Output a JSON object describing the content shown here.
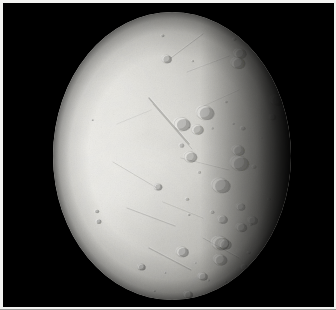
{
  "image": {
    "kind": "spacecraft-photograph",
    "subject": "icy moon",
    "alt_text": "Black-and-white spacecraft photograph of a bright icy moon, lit from the left, showing smooth grooved plains on the left and heavily cratered terrain toward the terminator on the right.",
    "background_color": "#000000",
    "border_color": "#f2f2f0",
    "width_px": 336,
    "height_px": 310
  },
  "body": {
    "name": "icy-moon-disk",
    "illumination": "lit from left, terminator on right",
    "disk": {
      "left_px": 50,
      "top_px": 9,
      "width_px": 238,
      "height_px": 288
    },
    "surface_colors": {
      "bright_limb": "#efeeea",
      "mid_plains": "#d6d5d0",
      "dusk_terrain": "#6b6a67",
      "terminator_shadow": "#0a0a09"
    }
  },
  "terrain": {
    "regions": [
      {
        "name": "smooth-plains",
        "location": "left and upper-center",
        "description": "bright, nearly craterless ice plains"
      },
      {
        "name": "grooved-fractures",
        "location": "center-left",
        "description": "linear ridges and troughs"
      },
      {
        "name": "cratered-highlands",
        "location": "right and lower-right",
        "description": "densely cratered older terrain near terminator"
      }
    ],
    "fractures": [
      {
        "x1": 96,
        "y1": 86,
        "x2": 136,
        "y2": 132,
        "w": 1.4,
        "o": 0.3
      },
      {
        "x1": 100,
        "y1": 92,
        "x2": 139,
        "y2": 137,
        "w": 0.9,
        "o": 0.22
      },
      {
        "x1": 60,
        "y1": 150,
        "x2": 104,
        "y2": 176,
        "w": 1.0,
        "o": 0.16
      },
      {
        "x1": 74,
        "y1": 196,
        "x2": 122,
        "y2": 214,
        "w": 1.1,
        "o": 0.18
      },
      {
        "x1": 118,
        "y1": 46,
        "x2": 150,
        "y2": 22,
        "w": 1.0,
        "o": 0.2
      },
      {
        "x1": 134,
        "y1": 60,
        "x2": 176,
        "y2": 44,
        "w": 0.8,
        "o": 0.16
      },
      {
        "x1": 128,
        "y1": 146,
        "x2": 176,
        "y2": 158,
        "w": 0.9,
        "o": 0.14
      },
      {
        "x1": 96,
        "y1": 236,
        "x2": 138,
        "y2": 258,
        "w": 1.2,
        "o": 0.22
      },
      {
        "x1": 146,
        "y1": 96,
        "x2": 186,
        "y2": 78,
        "w": 0.8,
        "o": 0.14
      },
      {
        "x1": 64,
        "y1": 112,
        "x2": 98,
        "y2": 98,
        "w": 0.8,
        "o": 0.12
      },
      {
        "x1": 110,
        "y1": 190,
        "x2": 150,
        "y2": 206,
        "w": 0.9,
        "o": 0.15
      },
      {
        "x1": 150,
        "y1": 226,
        "x2": 186,
        "y2": 246,
        "w": 1.0,
        "o": 0.18
      }
    ],
    "crater_count": 168
  },
  "labels": {
    "caption": "Icy moon imaged by a passing spacecraft"
  }
}
